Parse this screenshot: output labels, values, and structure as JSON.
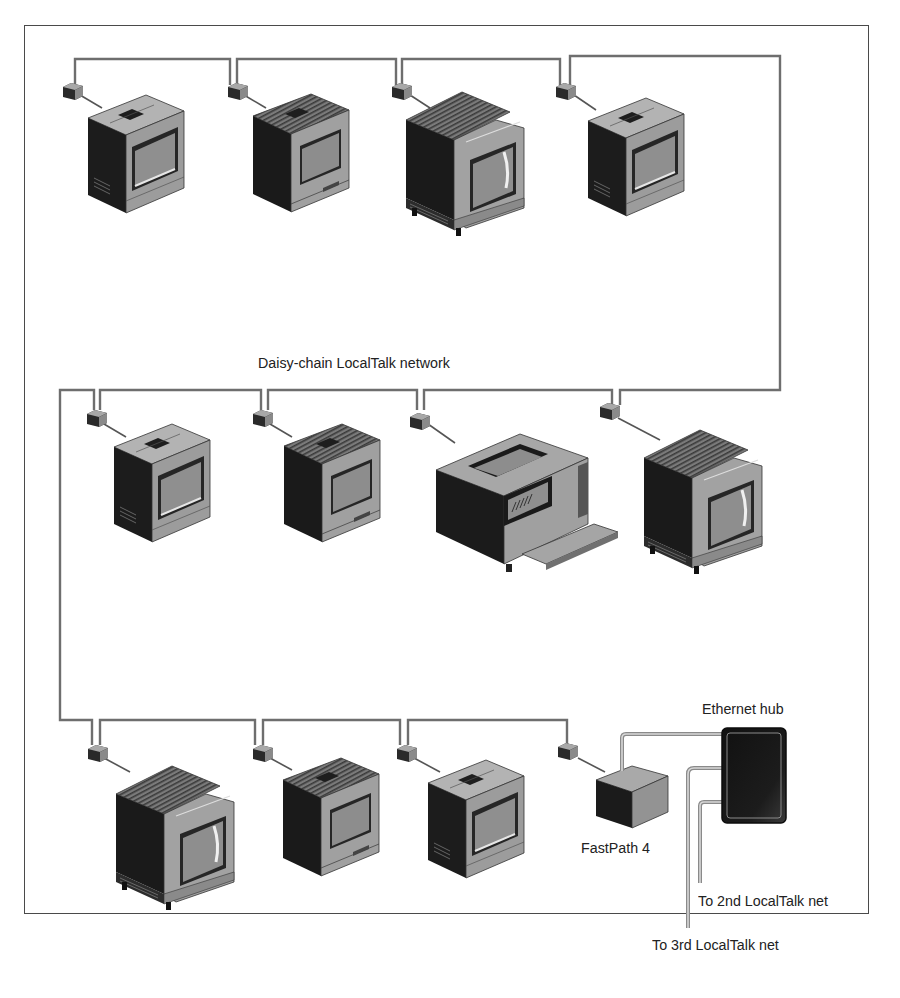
{
  "diagram": {
    "title": "Daisy-chain LocalTalk network",
    "colors": {
      "wire": "#6e6e6e",
      "device_dark": "#1e1e1e",
      "device_mid": "#8c8c8c",
      "device_light": "#b4b4b4",
      "screen": "#9a9a9a",
      "hub": "#151515",
      "ethernet_cable": "#b0b0b0",
      "frame": "#4a4a4a"
    },
    "rows": [
      {
        "name": "top-row",
        "devices": [
          {
            "type": "compact-mac",
            "label": ""
          },
          {
            "type": "classic-mac",
            "label": ""
          },
          {
            "type": "large-monitor-mac",
            "label": ""
          },
          {
            "type": "compact-mac",
            "label": ""
          }
        ]
      },
      {
        "name": "middle-row",
        "devices": [
          {
            "type": "compact-mac",
            "label": ""
          },
          {
            "type": "classic-mac",
            "label": ""
          },
          {
            "type": "laser-printer",
            "label": ""
          },
          {
            "type": "large-monitor-mac",
            "label": ""
          }
        ]
      },
      {
        "name": "bottom-row",
        "devices": [
          {
            "type": "large-monitor-mac",
            "label": ""
          },
          {
            "type": "classic-mac",
            "label": ""
          },
          {
            "type": "compact-mac",
            "label": ""
          },
          {
            "type": "router-box",
            "label": "FastPath 4"
          }
        ]
      }
    ],
    "labels": {
      "network": "Daisy-chain LocalTalk network",
      "router": "FastPath 4",
      "hub": "Ethernet hub",
      "net2": "To 2nd LocalTalk net",
      "net3": "To 3rd LocalTalk net"
    }
  }
}
